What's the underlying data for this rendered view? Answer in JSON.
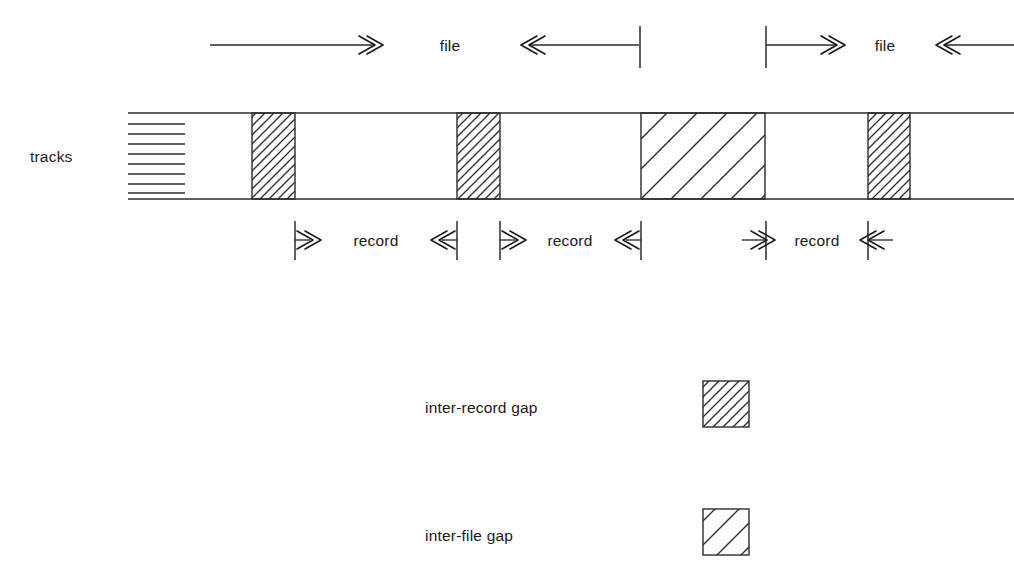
{
  "figure": {
    "background_color": "#ffffff",
    "ink_color": "#2b2b2b",
    "width": 1014,
    "height": 578
  },
  "labels": {
    "tracks": "tracks",
    "file_left": "file",
    "file_right": "file",
    "record_1": "record",
    "record_2": "record",
    "record_3": "record"
  },
  "legend": {
    "items": [
      {
        "label": "inter-record gap",
        "swatch": "dense-hatch-swatch",
        "hatch_density": "dense",
        "hatch_angle_deg": 45
      },
      {
        "label": "inter-file gap",
        "swatch": "sparse-hatch-swatch",
        "hatch_density": "sparse",
        "hatch_angle_deg": 45
      }
    ]
  },
  "tape": {
    "top_y": 113,
    "bottom_y": 199,
    "left_x": 128,
    "right_x": 1014,
    "track_count": 8,
    "track_left_x": 128,
    "track_right_x": 185,
    "blocks": [
      {
        "kind": "inter-record gap",
        "x": 252,
        "width": 43,
        "hatch": "dense"
      },
      {
        "kind": "inter-record gap",
        "x": 457,
        "width": 43,
        "hatch": "dense"
      },
      {
        "kind": "inter-file gap",
        "x": 641,
        "width": 124,
        "hatch": "sparse"
      },
      {
        "kind": "inter-record gap",
        "x": 868,
        "width": 42,
        "hatch": "dense"
      }
    ]
  },
  "file_dimension": {
    "line_y": 45,
    "segments": [
      {
        "name": "file-left-span-start",
        "x1": 210,
        "x2": 375,
        "arrow": "right-end"
      },
      {
        "name": "file-left-span-end",
        "x1": 528,
        "x2": 640,
        "arrow": "left-end",
        "tick_x": 640
      },
      {
        "name": "file-right-span-start",
        "x1": 765,
        "x2": 845,
        "arrow": "right-end",
        "tick_x": 765
      },
      {
        "name": "file-right-span-end",
        "x1": 930,
        "x2": 1014,
        "arrow": "left-end"
      }
    ],
    "label_positions": [
      {
        "text_key": "file_left",
        "x": 450
      },
      {
        "text_key": "file_right",
        "x": 885
      }
    ]
  },
  "record_dimension": {
    "line_y": 240,
    "tick_top_y": 221,
    "tick_bottom_y": 260,
    "records": [
      {
        "label_key": "record_1",
        "left_tick_x": 295,
        "right_tick_x": 457,
        "label_x": 376
      },
      {
        "label_key": "record_2",
        "left_tick_x": 500,
        "right_tick_x": 641,
        "label_x": 570
      },
      {
        "label_key": "record_3",
        "left_tick_x": 766,
        "right_tick_x": 868,
        "label_x": 817
      }
    ]
  },
  "legend_layout": {
    "rows": [
      {
        "label_x": 425,
        "label_y": 413,
        "swatch_x": 703,
        "swatch_y": 381,
        "swatch_size": 46
      },
      {
        "label_x": 425,
        "label_y": 541,
        "swatch_x": 703,
        "swatch_y": 509,
        "swatch_size": 46
      }
    ]
  }
}
